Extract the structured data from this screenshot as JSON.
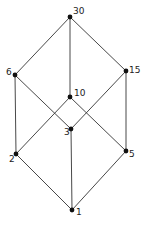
{
  "diagram": {
    "type": "hasse-diagram",
    "nodes": [
      {
        "id": "30",
        "label": "30",
        "x": 70,
        "y": 17,
        "lx": 73,
        "ly": 7
      },
      {
        "id": "6",
        "label": "6",
        "x": 15,
        "y": 75,
        "lx": 6,
        "ly": 68
      },
      {
        "id": "15",
        "label": "15",
        "x": 126,
        "y": 71,
        "lx": 129,
        "ly": 66
      },
      {
        "id": "10",
        "label": "10",
        "x": 70,
        "y": 97,
        "lx": 74,
        "ly": 89
      },
      {
        "id": "3",
        "label": "3",
        "x": 71,
        "y": 129,
        "lx": 64,
        "ly": 128
      },
      {
        "id": "2",
        "label": "2",
        "x": 16,
        "y": 154,
        "lx": 9,
        "ly": 155
      },
      {
        "id": "5",
        "label": "5",
        "x": 126,
        "y": 151,
        "lx": 129,
        "ly": 150
      },
      {
        "id": "1",
        "label": "1",
        "x": 72,
        "y": 210,
        "lx": 76,
        "ly": 208
      }
    ],
    "edges": [
      [
        "30",
        "6"
      ],
      [
        "30",
        "10"
      ],
      [
        "30",
        "15"
      ],
      [
        "6",
        "2"
      ],
      [
        "6",
        "3"
      ],
      [
        "15",
        "3"
      ],
      [
        "15",
        "5"
      ],
      [
        "10",
        "2"
      ],
      [
        "10",
        "5"
      ],
      [
        "2",
        "1"
      ],
      [
        "3",
        "1"
      ],
      [
        "5",
        "1"
      ]
    ]
  }
}
